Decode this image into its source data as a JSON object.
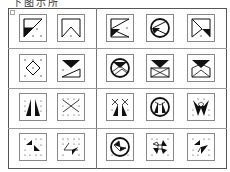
{
  "caption": "下图示所",
  "layout": {
    "rows": 4,
    "given_per_row": 2,
    "options_per_row": 3
  },
  "colors": {
    "ink": "#111111",
    "frame": "#555555",
    "cell_border": "#888888",
    "dot": "#333333"
  },
  "rows": [
    {
      "label": "row-1",
      "given": [
        "triangle-filled-lower-left-diagonal",
        "chevron-up-in-square"
      ],
      "options": [
        "triangle-fan-filled-lower-left",
        "circle-fan-filled-lower-left",
        "triangle-fan-filled-lower-right"
      ]
    },
    {
      "label": "row-2",
      "given": [
        "diamond-with-dots",
        "filled-triangle-over-right-triangle"
      ],
      "options": [
        "circle-with-filled-triangle-and-chevrons",
        "envelope-with-filled-triangle",
        "envelope-open-with-filled-triangle"
      ]
    },
    {
      "label": "row-3",
      "given": [
        "twin-filled-spikes",
        "dotted-x-cross"
      ],
      "options": [
        "twin-spikes-with-x",
        "circle-with-twin-spikes",
        "w-shape-with-spikes"
      ]
    },
    {
      "label": "row-4",
      "given": [
        "two-small-filled-triangles",
        "zigzag-with-filled-triangle"
      ],
      "options": [
        "circle-with-pinwheel",
        "four-point-star-with-square",
        "two-diagonal-filled-triangles"
      ]
    }
  ]
}
